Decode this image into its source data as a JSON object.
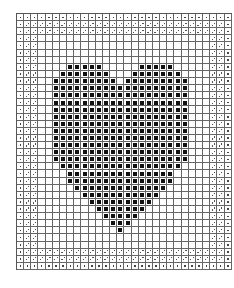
{
  "pattern": {
    "title": "Heart cross-stitch / filet chart",
    "columns": 30,
    "rows": 36,
    "colors": {
      "grid": "#666666",
      "filled": "#111111",
      "background": "#ffffff"
    },
    "legend": {
      "filled": "solid black square",
      "border_outer": "single dot",
      "border_inner": "diagonal two-dot",
      "empty": "blank"
    },
    "border": {
      "outer_width": 1,
      "inner_width": 2,
      "side_border_cols": 3,
      "top_rows": 3,
      "bottom_rows": 3
    },
    "heart_rows": [
      {
        "row": 7,
        "spans": [
          [
            7,
            11
          ],
          [
            17,
            21
          ]
        ]
      },
      {
        "row": 8,
        "spans": [
          [
            6,
            12
          ],
          [
            16,
            22
          ]
        ]
      },
      {
        "row": 9,
        "spans": [
          [
            5,
            13
          ],
          [
            15,
            23
          ]
        ]
      },
      {
        "row": 10,
        "spans": [
          [
            5,
            23
          ]
        ]
      },
      {
        "row": 11,
        "spans": [
          [
            5,
            23
          ]
        ]
      },
      {
        "row": 12,
        "spans": [
          [
            5,
            23
          ]
        ]
      },
      {
        "row": 13,
        "spans": [
          [
            5,
            23
          ]
        ]
      },
      {
        "row": 14,
        "spans": [
          [
            5,
            23
          ]
        ]
      },
      {
        "row": 15,
        "spans": [
          [
            5,
            23
          ]
        ]
      },
      {
        "row": 16,
        "spans": [
          [
            5,
            23
          ]
        ]
      },
      {
        "row": 17,
        "spans": [
          [
            5,
            23
          ]
        ]
      },
      {
        "row": 18,
        "spans": [
          [
            5,
            23
          ]
        ]
      },
      {
        "row": 19,
        "spans": [
          [
            5,
            23
          ]
        ]
      },
      {
        "row": 20,
        "spans": [
          [
            5,
            23
          ]
        ]
      },
      {
        "row": 21,
        "spans": [
          [
            6,
            22
          ]
        ]
      },
      {
        "row": 22,
        "spans": [
          [
            7,
            21
          ]
        ]
      },
      {
        "row": 23,
        "spans": [
          [
            7,
            21
          ]
        ]
      },
      {
        "row": 24,
        "spans": [
          [
            8,
            20
          ]
        ]
      },
      {
        "row": 25,
        "spans": [
          [
            9,
            19
          ]
        ]
      },
      {
        "row": 26,
        "spans": [
          [
            10,
            18
          ]
        ]
      },
      {
        "row": 27,
        "spans": [
          [
            11,
            17
          ]
        ]
      },
      {
        "row": 28,
        "spans": [
          [
            12,
            16
          ]
        ]
      },
      {
        "row": 29,
        "spans": [
          [
            13,
            15
          ]
        ]
      },
      {
        "row": 30,
        "spans": [
          [
            14,
            14
          ]
        ]
      }
    ]
  }
}
